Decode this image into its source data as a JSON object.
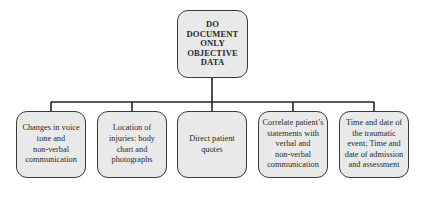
{
  "diagram": {
    "type": "tree",
    "root": {
      "label": "DO DOCUMENT ONLY OBJECTIVE DATA",
      "lines": [
        "DO",
        "DOCUMENT",
        "ONLY",
        "OBJECTIVE",
        "DATA"
      ]
    },
    "children": [
      {
        "label": "Changes in voice tone and non-verbal communication",
        "lines": [
          "Changes in voice",
          "tone and",
          "non-verbal",
          "communication"
        ]
      },
      {
        "label": "Location of injuries: body chart and photographs",
        "lines": [
          "Location of",
          "injuries: body",
          "chart and",
          "photographs"
        ]
      },
      {
        "label": "Direct patient quotes",
        "lines": [
          "Direct patient",
          "quotes"
        ]
      },
      {
        "label": "Correlate patient's statements with verbal and non-verbal communication",
        "lines": [
          "Correlate patient’s",
          "statements with",
          "verbal and",
          "non-verbal",
          "communication"
        ]
      },
      {
        "label": "Time and date of the traumatic event; Time and date of admission and assessment",
        "lines": [
          "Time and date of",
          "the traumatic",
          "event; Time and",
          "date of admission",
          "and assessment"
        ]
      }
    ],
    "colors": {
      "box_fill": "#e9e9e9",
      "border": "#3a3a3a",
      "connector": "#222222"
    }
  }
}
